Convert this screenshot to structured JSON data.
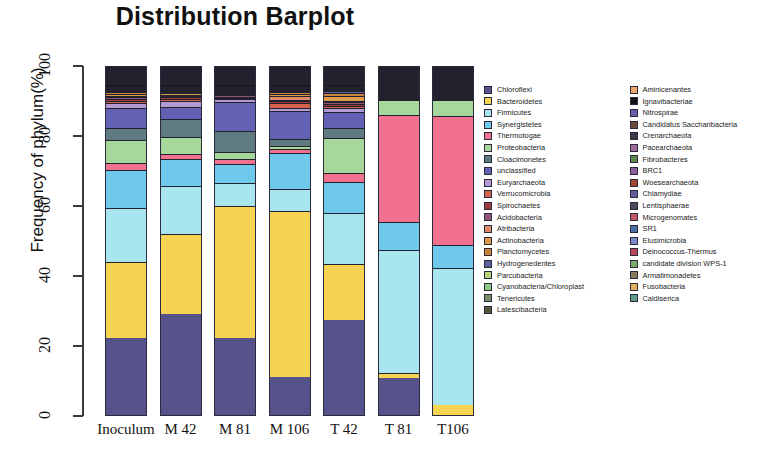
{
  "chart_data": {
    "type": "bar",
    "stacked": true,
    "title": "Distribution Barplot",
    "xlabel": "",
    "ylabel": "Frequency of phylum(%)",
    "ylim": [
      0,
      100
    ],
    "yticks": [
      0,
      20,
      40,
      60,
      80,
      100
    ],
    "grid": false,
    "legend_position": "right",
    "categories": [
      "Inoculum",
      "M 42",
      "M 81",
      "M 106",
      "T 42",
      "T 81",
      "T106"
    ],
    "series": [
      {
        "name": "Chloroflexi",
        "color": "#55528c",
        "values": [
          23.0,
          30.5,
          22.5,
          11.5,
          26.0,
          11.5,
          0.0
        ]
      },
      {
        "name": "Bacteroidetes",
        "color": "#f7d354",
        "values": [
          23.0,
          24.0,
          38.5,
          50.0,
          15.0,
          1.5,
          3.0
        ]
      },
      {
        "name": "Firmicutes",
        "color": "#a8e6ef",
        "values": [
          16.0,
          14.5,
          7.0,
          6.5,
          14.0,
          38.5,
          42.5
        ]
      },
      {
        "name": "Synergistetes",
        "color": "#6ec9ea",
        "values": [
          11.5,
          8.0,
          5.5,
          11.0,
          8.5,
          8.5,
          7.0
        ]
      },
      {
        "name": "Thermotogae",
        "color": "#f2718f",
        "values": [
          2.0,
          1.5,
          1.5,
          1.0,
          2.5,
          33.5,
          40.0
        ]
      },
      {
        "name": "Proteobacteria",
        "color": "#a5d89a",
        "values": [
          7.0,
          5.0,
          2.0,
          1.0,
          9.5,
          4.5,
          5.0
        ]
      },
      {
        "name": "Cloacimonetes",
        "color": "#5f7a80",
        "values": [
          3.5,
          5.5,
          6.0,
          2.0,
          2.5,
          0.4,
          0.3
        ]
      },
      {
        "name": "unclassified",
        "color": "#6460b4",
        "values": [
          6.0,
          3.5,
          8.5,
          8.5,
          4.5,
          0.3,
          0.3
        ]
      },
      {
        "name": "Euryarchaeota",
        "color": "#b39ad4",
        "values": [
          1.5,
          2.0,
          0.8,
          0.8,
          1.0,
          0.2,
          0.2
        ]
      },
      {
        "name": "Verrucomicrobia",
        "color": "#d4604e",
        "values": [
          0.6,
          0.5,
          0.4,
          1.5,
          0.5,
          0.1,
          0.1
        ]
      },
      {
        "name": "Spirochaetes",
        "color": "#9c3b3b",
        "values": [
          0.6,
          0.5,
          0.4,
          0.6,
          0.6,
          0.1,
          0.1
        ]
      },
      {
        "name": "Acidobacteria",
        "color": "#8f5577",
        "values": [
          0.5,
          0.4,
          0.4,
          0.5,
          0.5,
          0.1,
          0.1
        ]
      },
      {
        "name": "Atribacteria",
        "color": "#e08a6a",
        "values": [
          0.4,
          0.4,
          0.3,
          1.2,
          0.4,
          0.1,
          0.1
        ]
      },
      {
        "name": "Actinobacteria",
        "color": "#dd9a48",
        "values": [
          0.7,
          0.5,
          0.4,
          0.6,
          1.3,
          0.2,
          0.2
        ]
      },
      {
        "name": "Planctomycetes",
        "color": "#c9823c",
        "values": [
          0.5,
          0.4,
          0.3,
          0.5,
          0.9,
          0.1,
          0.1
        ]
      },
      {
        "name": "Hydrogenedentes",
        "color": "#5a5fa0",
        "values": [
          0.4,
          0.3,
          0.3,
          0.4,
          0.4,
          0.1,
          0.1
        ]
      },
      {
        "name": "Parcubacteria",
        "color": "#b8cf7a",
        "values": [
          0.3,
          0.3,
          0.2,
          0.3,
          0.3,
          0.1,
          0.1
        ]
      },
      {
        "name": "Cyanobacteria/Chloroplast",
        "color": "#8fc98a",
        "values": [
          0.3,
          0.2,
          0.2,
          0.3,
          0.3,
          0.1,
          0.1
        ]
      },
      {
        "name": "Tenericutes",
        "color": "#7a8a6a",
        "values": [
          0.2,
          0.2,
          0.2,
          0.2,
          0.2,
          0.1,
          0.1
        ]
      },
      {
        "name": "Latescibacteria",
        "color": "#4c5a3a",
        "values": [
          0.2,
          0.2,
          0.2,
          0.2,
          0.2,
          0.1,
          0.1
        ]
      },
      {
        "name": "Aminicenantes",
        "color": "#f0a868",
        "values": [
          0.2,
          0.2,
          0.2,
          0.2,
          0.2,
          0.1,
          0.1
        ]
      },
      {
        "name": "Ignavibacteriae",
        "color": "#141414",
        "values": [
          0.5,
          0.5,
          0.5,
          0.5,
          0.5,
          0.3,
          0.3
        ]
      },
      {
        "name": "Nitrospirae",
        "color": "#6a5fa8",
        "values": [
          0.2,
          0.2,
          0.2,
          0.2,
          0.2,
          0.1,
          0.1
        ]
      },
      {
        "name": "Candidatus Saccharibacteria",
        "color": "#6b4a3a",
        "values": [
          0.3,
          0.3,
          0.3,
          0.3,
          0.3,
          0.2,
          0.2
        ]
      },
      {
        "name": "Crenarchaeota",
        "color": "#3a3a4a",
        "values": [
          0.2,
          0.2,
          0.2,
          0.2,
          0.2,
          0.1,
          0.1
        ]
      },
      {
        "name": "Pacearchaeota",
        "color": "#a06a9a",
        "values": [
          0.2,
          0.2,
          0.2,
          0.2,
          0.2,
          0.1,
          0.1
        ]
      },
      {
        "name": "Fibrobacteres",
        "color": "#5a8a4a",
        "values": [
          0.2,
          0.2,
          0.2,
          0.2,
          0.2,
          0.1,
          0.1
        ]
      },
      {
        "name": "BRC1",
        "color": "#8a5f9a",
        "values": [
          0.2,
          0.2,
          0.2,
          0.2,
          0.2,
          0.1,
          0.1
        ]
      },
      {
        "name": "Woesearchaeota",
        "color": "#a0472f",
        "values": [
          0.3,
          0.3,
          0.3,
          0.3,
          0.3,
          0.2,
          0.2
        ]
      },
      {
        "name": "Chlamydiae",
        "color": "#5f5f9a",
        "values": [
          0.2,
          0.2,
          0.2,
          0.2,
          0.2,
          0.1,
          0.1
        ]
      },
      {
        "name": "Lentisphaerae",
        "color": "#4a4a5a",
        "values": [
          0.2,
          0.2,
          0.2,
          0.2,
          0.2,
          0.1,
          0.1
        ]
      },
      {
        "name": "Microgenomates",
        "color": "#c4566a",
        "values": [
          0.2,
          0.2,
          0.2,
          0.2,
          0.2,
          0.1,
          0.1
        ]
      },
      {
        "name": "SR1",
        "color": "#4a6fa8",
        "values": [
          0.2,
          0.2,
          0.2,
          0.2,
          0.2,
          0.1,
          0.1
        ]
      },
      {
        "name": "Elusimicrobia",
        "color": "#7a8ac4",
        "values": [
          0.2,
          0.2,
          0.2,
          0.2,
          0.2,
          0.1,
          0.1
        ]
      },
      {
        "name": "Deinococcus-Thermus",
        "color": "#b8485a",
        "values": [
          0.2,
          0.2,
          0.2,
          0.2,
          0.2,
          0.1,
          0.1
        ]
      },
      {
        "name": "candidate division WPS-1",
        "color": "#7aab6a",
        "values": [
          0.2,
          0.2,
          0.2,
          0.2,
          0.2,
          0.1,
          0.1
        ]
      },
      {
        "name": "Armatimonadetes",
        "color": "#8a7a5a",
        "values": [
          0.2,
          0.2,
          0.2,
          0.2,
          0.2,
          0.1,
          0.1
        ]
      },
      {
        "name": "Fusobacteria",
        "color": "#e0b060",
        "values": [
          0.2,
          0.2,
          0.2,
          0.2,
          0.2,
          0.1,
          0.1
        ]
      },
      {
        "name": "Caldiserica",
        "color": "#5f9a8a",
        "values": [
          0.2,
          0.2,
          0.2,
          0.2,
          0.2,
          0.1,
          0.1
        ]
      }
    ]
  },
  "axis": {
    "y_tick_labels": [
      "0",
      "20",
      "40",
      "60",
      "80",
      "100"
    ]
  },
  "legend": {
    "column_split": 20
  }
}
